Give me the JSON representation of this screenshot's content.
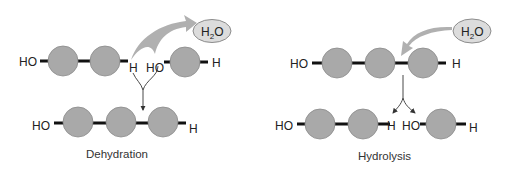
{
  "colors": {
    "monomer_fill": "#a9a9a9",
    "monomer_stroke": "#8a8a8a",
    "bond": "#111111",
    "big_arrow": "#b0b0b0",
    "water_fill": "#dcdcdc",
    "water_stroke": "#8c8c8c",
    "thin_arrow": "#333333",
    "text": "#222222"
  },
  "dehydration": {
    "caption": "Dehydration",
    "water": {
      "main": "H",
      "subscript": "2",
      "tail": "O"
    },
    "reactant_left": {
      "left_group": "HO",
      "right_group": "H",
      "monomers": 2
    },
    "reactant_right": {
      "left_group": "HO",
      "right_group": "H",
      "monomers": 1
    },
    "product": {
      "left_group": "HO",
      "right_group": "H",
      "monomers": 3
    }
  },
  "hydrolysis": {
    "caption": "Hydrolysis",
    "water": {
      "main": "H",
      "subscript": "2",
      "tail": "O"
    },
    "reactant": {
      "left_group": "HO",
      "right_group": "H",
      "monomers": 3
    },
    "product_left": {
      "left_group": "HO",
      "right_group": "H",
      "monomers": 2
    },
    "product_right": {
      "left_group": "HO",
      "right_group": "H",
      "monomers": 1
    }
  }
}
